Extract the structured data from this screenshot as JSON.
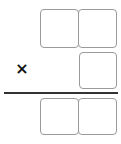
{
  "problem": {
    "type": "multiplication-layout",
    "operator": "×",
    "multiplicand": {
      "digit_boxes": [
        "",
        ""
      ]
    },
    "multiplier": {
      "digit_boxes": [
        ""
      ]
    },
    "product": {
      "digit_boxes": [
        "",
        ""
      ]
    }
  },
  "colors": {
    "box_border": "#9a9a9a",
    "rule": "#333333",
    "operator": "#111111"
  }
}
